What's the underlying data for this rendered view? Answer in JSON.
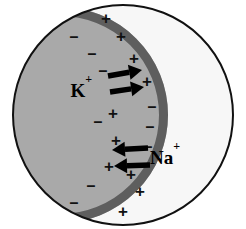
{
  "figure": {
    "type": "diagram",
    "background_color": "#ffffff"
  },
  "colors": {
    "cell_outline": "#111111",
    "extracellular_fill": "#f7f7f7",
    "cytoplasm_fill": "#a9a9a9",
    "membrane_band": "#5e5e5e",
    "sign_color": "#111111",
    "arrow_color": "#000000",
    "label_color": "#000000"
  },
  "cell": {
    "outline_shape": "circle",
    "cx": 123,
    "cy": 115,
    "r": 110,
    "outline_width": 2
  },
  "cytoplasm": {
    "shape": "circle",
    "cx": 60,
    "cy": 115,
    "r": 108,
    "description": "shaded intracellular region on the left"
  },
  "membrane": {
    "description": "thick dark arc forming the right boundary of the cytoplasm",
    "thickness": 9
  },
  "ions": [
    {
      "id": "potassium",
      "label_element": "K",
      "label_charge": "+",
      "label_full": "K+",
      "direction": "outward",
      "arrow_count": 2,
      "x": 92,
      "y": 93
    },
    {
      "id": "sodium",
      "label_element": "Na",
      "label_charge": "+",
      "label_full": "Na+",
      "direction": "inward",
      "arrow_count": 2,
      "x": 150,
      "y": 160
    }
  ],
  "arrows": [
    {
      "id": "k-arrow-upper",
      "ion": "potassium",
      "x1": 108,
      "y1": 76,
      "x2": 142,
      "y2": 70,
      "points": "outward-right"
    },
    {
      "id": "k-arrow-lower",
      "ion": "potassium",
      "x1": 110,
      "y1": 92,
      "x2": 144,
      "y2": 87,
      "points": "outward-right"
    },
    {
      "id": "na-arrow-upper",
      "ion": "sodium",
      "x1": 148,
      "y1": 148,
      "x2": 112,
      "y2": 150,
      "points": "inward-left"
    },
    {
      "id": "na-arrow-lower",
      "ion": "sodium",
      "x1": 150,
      "y1": 165,
      "x2": 114,
      "y2": 166,
      "points": "inward-left"
    }
  ],
  "charges": {
    "negative_symbol": "–",
    "positive_symbol": "+",
    "negative_label": "negative charges inside the cell",
    "positive_label": "positive charges outside the cell",
    "inner_negatives": [
      {
        "x": 74,
        "y": 36,
        "size": 16
      },
      {
        "x": 92,
        "y": 53,
        "size": 16
      },
      {
        "x": 103,
        "y": 70,
        "size": 16
      },
      {
        "x": 98,
        "y": 121,
        "size": 16
      },
      {
        "x": 91,
        "y": 185,
        "size": 16
      },
      {
        "x": 74,
        "y": 202,
        "size": 16
      }
    ],
    "inner_positives": [
      {
        "x": 113,
        "y": 113,
        "size": 17
      },
      {
        "x": 116,
        "y": 140,
        "size": 17
      },
      {
        "x": 109,
        "y": 166,
        "size": 17
      }
    ],
    "outer_positives": [
      {
        "x": 106,
        "y": 18,
        "size": 17
      },
      {
        "x": 121,
        "y": 36,
        "size": 17
      },
      {
        "x": 134,
        "y": 58,
        "size": 17
      },
      {
        "x": 147,
        "y": 81,
        "size": 17
      },
      {
        "x": 131,
        "y": 174,
        "size": 17
      },
      {
        "x": 140,
        "y": 191,
        "size": 17
      },
      {
        "x": 123,
        "y": 211,
        "size": 17
      }
    ],
    "outer_negatives": [
      {
        "x": 152,
        "y": 106,
        "size": 16
      },
      {
        "x": 150,
        "y": 126,
        "size": 16
      },
      {
        "x": 148,
        "y": 146,
        "size": 16
      }
    ]
  }
}
